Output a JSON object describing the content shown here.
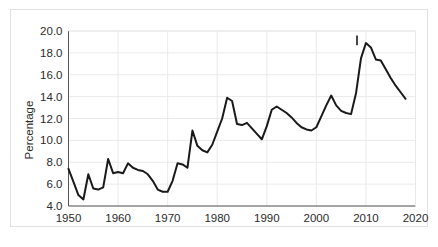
{
  "chart_data": {
    "type": "line",
    "title": "",
    "xlabel": "",
    "ylabel": "Percentage",
    "xlim": [
      1950,
      2020
    ],
    "ylim": [
      4.0,
      20.0
    ],
    "grid": true,
    "legend": null,
    "xticks": [
      "1950",
      "1960",
      "1970",
      "1980",
      "1990",
      "2000",
      "2010",
      "2020"
    ],
    "xtick_values": [
      1950,
      1960,
      1970,
      1980,
      1990,
      2000,
      2010,
      2020
    ],
    "yticks": [
      "4.0",
      "6.0",
      "8.0",
      "10.0",
      "12.0",
      "14.0",
      "16.0",
      "18.0",
      "20.0"
    ],
    "ytick_values": [
      4.0,
      6.0,
      8.0,
      10.0,
      12.0,
      14.0,
      16.0,
      18.0,
      20.0
    ],
    "line_color": "#1a1a1a",
    "line_width": 2.0,
    "x": [
      1950,
      1951,
      1952,
      1953,
      1954,
      1955,
      1956,
      1957,
      1958,
      1959,
      1960,
      1961,
      1962,
      1963,
      1964,
      1965,
      1966,
      1967,
      1968,
      1969,
      1970,
      1971,
      1972,
      1973,
      1974,
      1975,
      1976,
      1977,
      1978,
      1979,
      1980,
      1981,
      1982,
      1983,
      1984,
      1985,
      1986,
      1987,
      1988,
      1989,
      1990,
      1991,
      1992,
      1993,
      1994,
      1995,
      1996,
      1997,
      1998,
      1999,
      2000,
      2001,
      2002,
      2003,
      2004,
      2005,
      2006,
      2007,
      2008,
      2009,
      2010,
      2011,
      2012,
      2013,
      2014,
      2015,
      2016,
      2017,
      2018
    ],
    "values": [
      7.4,
      6.2,
      5.0,
      4.6,
      6.9,
      5.6,
      5.5,
      5.7,
      8.3,
      7.0,
      7.1,
      7.0,
      7.9,
      7.5,
      7.3,
      7.2,
      6.9,
      6.3,
      5.5,
      5.3,
      5.3,
      6.3,
      7.9,
      7.8,
      7.5,
      10.9,
      9.5,
      9.1,
      8.9,
      9.6,
      10.8,
      12.0,
      13.9,
      13.6,
      11.5,
      11.4,
      11.6,
      11.1,
      10.6,
      10.1,
      11.3,
      12.8,
      13.1,
      12.8,
      12.5,
      12.1,
      11.6,
      11.2,
      11.0,
      10.9,
      11.2,
      12.2,
      13.2,
      14.1,
      13.2,
      12.7,
      12.5,
      12.4,
      14.3,
      17.5,
      18.9,
      18.5,
      17.4,
      17.3,
      16.5,
      15.7,
      15.0,
      14.4,
      13.8
    ],
    "annotations": [
      {
        "name": "peak-tick-mark",
        "type": "vertical-tick",
        "x": 2008.2,
        "y_top": 19.6,
        "y_bottom": 18.7,
        "color": "#1a1a1a"
      }
    ],
    "peaks": [
      {
        "x": 1958,
        "y": 8.3
      },
      {
        "x": 1975,
        "y": 10.9
      },
      {
        "x": 1983,
        "y": 13.9
      },
      {
        "x": 1992,
        "y": 13.1
      },
      {
        "x": 2003,
        "y": 14.1
      },
      {
        "x": 2010,
        "y": 18.9
      }
    ],
    "troughs": [
      {
        "x": 1953,
        "y": 4.6
      },
      {
        "x": 1970,
        "y": 5.3
      },
      {
        "x": 1989,
        "y": 10.1
      },
      {
        "x": 1999,
        "y": 10.9
      }
    ]
  },
  "axes": {
    "y_axis_title": "Percentage"
  }
}
